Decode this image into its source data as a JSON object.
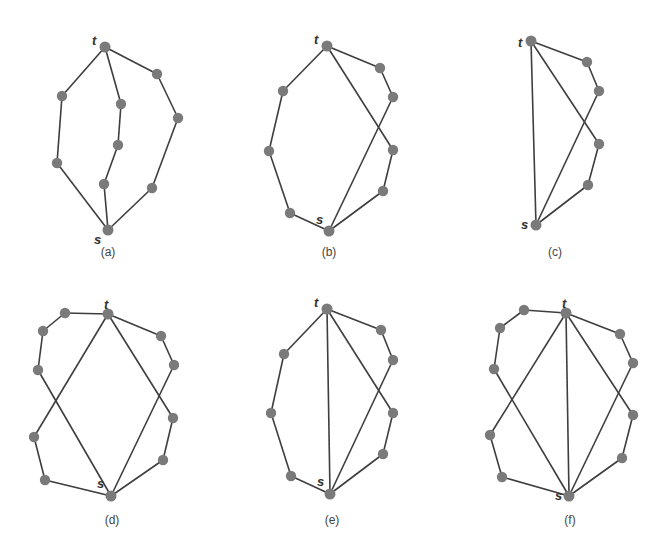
{
  "figure": {
    "panels": [
      {
        "id": "a",
        "caption": "(a)",
        "source_label": "s",
        "sink_label": "t",
        "paths": [
          [
            "t",
            "a1",
            "a2",
            "s"
          ],
          [
            "t",
            "b1",
            "b2",
            "b3",
            "s"
          ],
          [
            "t",
            "c1",
            "c2",
            "c3",
            "s"
          ]
        ]
      },
      {
        "id": "b",
        "caption": "(b)",
        "source_label": "s",
        "sink_label": "t",
        "paths": [
          [
            "t",
            "a1",
            "a2",
            "a3",
            "s"
          ],
          [
            "t",
            "b1",
            "b2",
            "s"
          ],
          [
            "t",
            "c1",
            "c2",
            "s"
          ]
        ]
      },
      {
        "id": "c",
        "caption": "(c)",
        "source_label": "s",
        "sink_label": "t",
        "paths": [
          [
            "t",
            "s"
          ],
          [
            "t",
            "b1",
            "b2",
            "s"
          ],
          [
            "t",
            "c1",
            "c2",
            "s"
          ]
        ]
      },
      {
        "id": "d",
        "caption": "(d)",
        "source_label": "s",
        "sink_label": "t",
        "paths": [
          [
            "t",
            "a1",
            "a2",
            "a3",
            "s"
          ],
          [
            "t",
            "d1",
            "d2",
            "s"
          ],
          [
            "t",
            "b1",
            "b2",
            "s"
          ],
          [
            "t",
            "c1",
            "c2",
            "s"
          ]
        ]
      },
      {
        "id": "e",
        "caption": "(e)",
        "source_label": "s",
        "sink_label": "t",
        "paths": [
          [
            "t",
            "a1",
            "a2",
            "a3",
            "s"
          ],
          [
            "t",
            "s"
          ],
          [
            "t",
            "b1",
            "b2",
            "s"
          ],
          [
            "t",
            "c1",
            "c2",
            "s"
          ]
        ]
      },
      {
        "id": "f",
        "caption": "(f)",
        "source_label": "s",
        "sink_label": "t",
        "paths": [
          [
            "t",
            "a1",
            "a2",
            "a3",
            "s"
          ],
          [
            "t",
            "d1",
            "d2",
            "s"
          ],
          [
            "t",
            "s"
          ],
          [
            "t",
            "b1",
            "b2",
            "s"
          ],
          [
            "t",
            "c1",
            "c2",
            "s"
          ]
        ]
      }
    ]
  }
}
